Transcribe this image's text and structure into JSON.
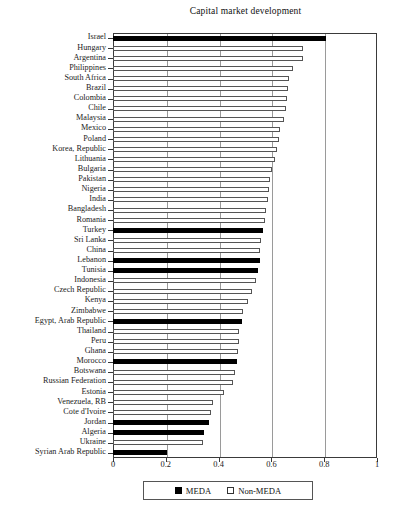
{
  "chart_data": {
    "type": "bar",
    "orientation": "horizontal",
    "title": "Capital market development",
    "xlabel": "",
    "ylabel": "",
    "xlim": [
      0,
      1
    ],
    "xticks": [
      "0",
      "0.2",
      "0.4",
      "0.6",
      "0.8",
      "1"
    ],
    "xtick_values": [
      0,
      0.2,
      0.4,
      0.6,
      0.8,
      1
    ],
    "grid": true,
    "grid_axis": "x",
    "legend_position": "bottom",
    "legend": [
      {
        "label": "MEDA",
        "key": "meda",
        "color": "#000000"
      },
      {
        "label": "Non-MEDA",
        "key": "nonmeda",
        "color": "#ffffff"
      }
    ],
    "categories": [
      "Israel",
      "Hungary",
      "Argentina",
      "Philippines",
      "South Africa",
      "Brazil",
      "Colombia",
      "Chile",
      "Malaysia",
      "Mexico",
      "Poland",
      "Korea, Republic",
      "Lithuania",
      "Bulgaria",
      "Pakistan",
      "Nigeria",
      "India",
      "Bangladesh",
      "Romania",
      "Turkey",
      "Sri Lanka",
      "China",
      "Lebanon",
      "Tunisia",
      "Indonesia",
      "Czech Republic",
      "Kenya",
      "Zimbabwe",
      "Egypt, Arab Republic",
      "Thailand",
      "Peru",
      "Ghana",
      "Morocco",
      "Botswana",
      "Russian Federation",
      "Estonia",
      "Venezuela, RB",
      "Cote d'Ivoire",
      "Jordan",
      "Algeria",
      "Ukraine",
      "Syrian Arab Republic"
    ],
    "values": [
      0.805,
      0.72,
      0.718,
      0.682,
      0.665,
      0.662,
      0.66,
      0.657,
      0.648,
      0.634,
      0.628,
      0.62,
      0.612,
      0.602,
      0.596,
      0.592,
      0.588,
      0.58,
      0.575,
      0.57,
      0.562,
      0.558,
      0.556,
      0.548,
      0.54,
      0.525,
      0.512,
      0.492,
      0.487,
      0.478,
      0.476,
      0.472,
      0.47,
      0.462,
      0.455,
      0.42,
      0.378,
      0.372,
      0.362,
      0.345,
      0.34,
      0.205
    ],
    "groups": [
      "meda",
      "nonmeda",
      "nonmeda",
      "nonmeda",
      "nonmeda",
      "nonmeda",
      "nonmeda",
      "nonmeda",
      "nonmeda",
      "nonmeda",
      "nonmeda",
      "nonmeda",
      "nonmeda",
      "nonmeda",
      "nonmeda",
      "nonmeda",
      "nonmeda",
      "nonmeda",
      "nonmeda",
      "meda",
      "nonmeda",
      "nonmeda",
      "meda",
      "meda",
      "nonmeda",
      "nonmeda",
      "nonmeda",
      "nonmeda",
      "meda",
      "nonmeda",
      "nonmeda",
      "nonmeda",
      "meda",
      "nonmeda",
      "nonmeda",
      "nonmeda",
      "nonmeda",
      "nonmeda",
      "meda",
      "meda",
      "nonmeda",
      "meda"
    ]
  }
}
